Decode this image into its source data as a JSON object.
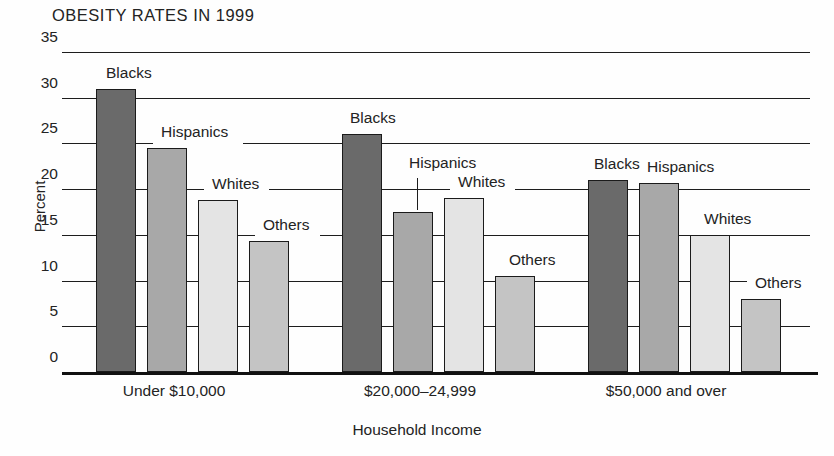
{
  "chart_data": {
    "type": "bar",
    "title": "OBESITY RATES IN 1999",
    "xlabel": "Household Income",
    "ylabel": "Percent",
    "categories": [
      "Under $10,000",
      "$20,000–24,999",
      "$50,000 and over"
    ],
    "series": [
      {
        "name": "Blacks",
        "values": [
          31.0,
          26.0,
          21.0
        ]
      },
      {
        "name": "Hispanics",
        "values": [
          24.5,
          17.5,
          20.7
        ]
      },
      {
        "name": "Whites",
        "values": [
          18.8,
          19.0,
          15.0
        ]
      },
      {
        "name": "Others",
        "values": [
          14.3,
          10.5,
          8.0
        ]
      }
    ],
    "ylim": [
      0,
      35
    ],
    "yticks": [
      "0",
      "5",
      "10",
      "15",
      "20",
      "25",
      "30",
      "35"
    ],
    "grid": true,
    "legend": "inline-labels",
    "colors": {
      "Blacks": "#6a6a6a",
      "Hispanics": "#a8a8a8",
      "Whites": "#e4e4e4",
      "Others": "#c4c4c4"
    }
  },
  "bar_labels": [
    {
      "text": "Blacks"
    },
    {
      "text": "Hispanics"
    },
    {
      "text": "Whites"
    },
    {
      "text": "Others"
    },
    {
      "text": "Blacks"
    },
    {
      "text": "Hispanics"
    },
    {
      "text": "Whites"
    },
    {
      "text": "Others"
    },
    {
      "text": "Blacks"
    },
    {
      "text": "Hispanics"
    },
    {
      "text": "Whites"
    },
    {
      "text": "Others"
    }
  ]
}
